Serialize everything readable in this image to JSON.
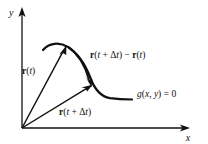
{
  "figure": {
    "background_color": "#ffffff",
    "ink_color": "#111111",
    "axes": {
      "x_label": "x",
      "y_label": "y",
      "origin": {
        "x": 22,
        "y": 128
      },
      "x_axis_end": {
        "x": 190,
        "y": 128
      },
      "y_axis_end": {
        "x": 22,
        "y": 9
      }
    },
    "labels": {
      "r_of_t": {
        "parts": {
          "vec": "r",
          "open": "(",
          "t": "t",
          "close": ")"
        },
        "plain": "r(t)",
        "x": 22,
        "y": 74
      },
      "r_of_t_plus_dt": {
        "parts": {
          "vec": "r",
          "open": "(",
          "t": "t",
          "plus": " + ",
          "delta": "Δ",
          "t2": "t",
          "close": ")"
        },
        "plain": "r(t + Δt)",
        "x": 59,
        "y": 115
      },
      "difference": {
        "plain": "r(t + Δt) − r(t)",
        "parts": {
          "vec1": "r",
          "open1": "(",
          "t1": "t",
          "plus": " + ",
          "delta": "Δ",
          "t2": "t",
          "close1": ")",
          "minus": " − ",
          "vec2": "r",
          "open2": "(",
          "t3": "t",
          "close2": ")"
        },
        "x": 90,
        "y": 58
      },
      "curve_equation": {
        "plain": "g(x, y) = 0",
        "parts": {
          "g": "g",
          "open": "(",
          "x": "x",
          "comma": ", ",
          "y": "y",
          "close": ")",
          "equals": " = ",
          "zero": "0"
        },
        "x": 137,
        "y": 97
      }
    },
    "geometry": {
      "curve_description": "open curve rising from left, peaking near (66,45), descending steeply then flattening to the right",
      "curve_path": "M 43 50 C 49 43, 59 42, 68 47 C 80 53, 86 64, 91 78 C 95 89, 100 96, 110 98 C 118 99, 126 99, 132 99",
      "vector_r_t": {
        "from": {
          "x": 22,
          "y": 128
        },
        "to": {
          "x": 66,
          "y": 46
        }
      },
      "vector_r_t_plus_dt": {
        "from": {
          "x": 22,
          "y": 128
        },
        "to": {
          "x": 92,
          "y": 85
        }
      },
      "difference_arc": {
        "from": {
          "x": 68,
          "y": 47
        },
        "to": {
          "x": 91,
          "y": 84
        },
        "bulge": "right"
      }
    }
  }
}
